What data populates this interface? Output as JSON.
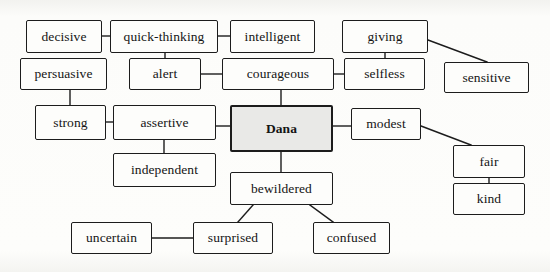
{
  "diagram": {
    "type": "concept-map",
    "background_color": "#fbfbf9",
    "node_fill": "#fdfdfb",
    "central_node_fill": "#e9e9e7",
    "border_color": "#1c1c1c",
    "edge_color": "#1c1c1c",
    "central_node": "Dana",
    "nodes": [
      {
        "id": "decisive",
        "label": "decisive",
        "x": 26,
        "y": 20,
        "w": 76,
        "h": 33,
        "central": false
      },
      {
        "id": "quick-thinking",
        "label": "quick-thinking",
        "x": 110,
        "y": 20,
        "w": 108,
        "h": 33,
        "central": false
      },
      {
        "id": "intelligent",
        "label": "intelligent",
        "x": 230,
        "y": 20,
        "w": 85,
        "h": 33,
        "central": false
      },
      {
        "id": "giving",
        "label": "giving",
        "x": 342,
        "y": 20,
        "w": 86,
        "h": 33,
        "central": false
      },
      {
        "id": "persuasive",
        "label": "persuasive",
        "x": 20,
        "y": 58,
        "w": 87,
        "h": 32,
        "central": false
      },
      {
        "id": "alert",
        "label": "alert",
        "x": 129,
        "y": 58,
        "w": 72,
        "h": 32,
        "central": false
      },
      {
        "id": "courageous",
        "label": "courageous",
        "x": 222,
        "y": 58,
        "w": 112,
        "h": 32,
        "central": false
      },
      {
        "id": "selfless",
        "label": "selfless",
        "x": 344,
        "y": 58,
        "w": 81,
        "h": 32,
        "central": false
      },
      {
        "id": "sensitive",
        "label": "sensitive",
        "x": 444,
        "y": 62,
        "w": 85,
        "h": 31,
        "central": false
      },
      {
        "id": "strong",
        "label": "strong",
        "x": 35,
        "y": 105,
        "w": 71,
        "h": 35,
        "central": false
      },
      {
        "id": "assertive",
        "label": "assertive",
        "x": 113,
        "y": 105,
        "w": 103,
        "h": 35,
        "central": false
      },
      {
        "id": "dana",
        "label": "Dana",
        "x": 230,
        "y": 105,
        "w": 103,
        "h": 47,
        "central": true
      },
      {
        "id": "modest",
        "label": "modest",
        "x": 351,
        "y": 108,
        "w": 70,
        "h": 32,
        "central": false
      },
      {
        "id": "fair",
        "label": "fair",
        "x": 453,
        "y": 145,
        "w": 72,
        "h": 33,
        "central": false
      },
      {
        "id": "independent",
        "label": "independent",
        "x": 113,
        "y": 153,
        "w": 103,
        "h": 34,
        "central": false
      },
      {
        "id": "bewildered",
        "label": "bewildered",
        "x": 230,
        "y": 172,
        "w": 103,
        "h": 33,
        "central": false
      },
      {
        "id": "kind",
        "label": "kind",
        "x": 453,
        "y": 183,
        "w": 72,
        "h": 32,
        "central": false
      },
      {
        "id": "uncertain",
        "label": "uncertain",
        "x": 71,
        "y": 222,
        "w": 81,
        "h": 32,
        "central": false
      },
      {
        "id": "surprised",
        "label": "surprised",
        "x": 193,
        "y": 222,
        "w": 80,
        "h": 32,
        "central": false
      },
      {
        "id": "confused",
        "label": "confused",
        "x": 313,
        "y": 222,
        "w": 77,
        "h": 32,
        "central": false
      }
    ],
    "edges": [
      {
        "from": "decisive",
        "to": "quick-thinking",
        "x1": 102,
        "y1": 36,
        "x2": 110,
        "y2": 36
      },
      {
        "from": "quick-thinking",
        "to": "intelligent",
        "x1": 218,
        "y1": 36,
        "x2": 230,
        "y2": 36
      },
      {
        "from": "quick-thinking",
        "to": "alert",
        "x1": 165,
        "y1": 53,
        "x2": 165,
        "y2": 58
      },
      {
        "from": "persuasive",
        "to": "strong",
        "x1": 70,
        "y1": 90,
        "x2": 70,
        "y2": 105
      },
      {
        "from": "alert",
        "to": "courageous",
        "x1": 201,
        "y1": 74,
        "x2": 222,
        "y2": 74
      },
      {
        "from": "courageous",
        "to": "selfless",
        "x1": 334,
        "y1": 74,
        "x2": 344,
        "y2": 74
      },
      {
        "from": "courageous",
        "to": "dana",
        "x1": 281,
        "y1": 90,
        "x2": 281,
        "y2": 105
      },
      {
        "from": "giving",
        "to": "selfless",
        "x1": 385,
        "y1": 53,
        "x2": 385,
        "y2": 58
      },
      {
        "from": "giving",
        "to": "sensitive",
        "x1": 428,
        "y1": 40,
        "x2": 487,
        "y2": 62
      },
      {
        "from": "strong",
        "to": "assertive",
        "x1": 106,
        "y1": 122,
        "x2": 113,
        "y2": 122
      },
      {
        "from": "assertive",
        "to": "dana",
        "x1": 216,
        "y1": 126,
        "x2": 230,
        "y2": 126
      },
      {
        "from": "assertive",
        "to": "independent",
        "x1": 164,
        "y1": 140,
        "x2": 164,
        "y2": 153
      },
      {
        "from": "dana",
        "to": "modest",
        "x1": 333,
        "y1": 126,
        "x2": 351,
        "y2": 126
      },
      {
        "from": "dana",
        "to": "bewildered",
        "x1": 281,
        "y1": 152,
        "x2": 281,
        "y2": 172
      },
      {
        "from": "modest",
        "to": "fair",
        "x1": 421,
        "y1": 126,
        "x2": 471,
        "y2": 145
      },
      {
        "from": "fair",
        "to": "kind",
        "x1": 489,
        "y1": 178,
        "x2": 489,
        "y2": 183
      },
      {
        "from": "bewildered",
        "to": "surprised",
        "x1": 253,
        "y1": 205,
        "x2": 238,
        "y2": 222
      },
      {
        "from": "bewildered",
        "to": "confused",
        "x1": 310,
        "y1": 205,
        "x2": 333,
        "y2": 222
      },
      {
        "from": "uncertain",
        "to": "surprised",
        "x1": 152,
        "y1": 238,
        "x2": 193,
        "y2": 238
      }
    ]
  }
}
